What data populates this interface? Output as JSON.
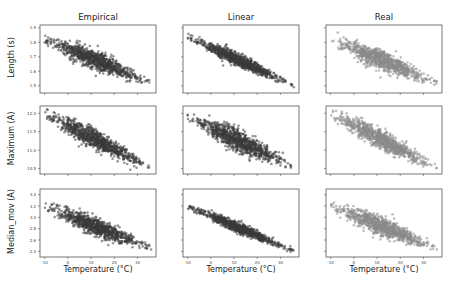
{
  "figure": {
    "columns": [
      "Empirical",
      "Linear",
      "Real"
    ],
    "rows": [
      "Length (s)",
      "Maximum (A)",
      "Median_mov (A)"
    ],
    "xlabel": "Temperature (°C)"
  },
  "colors": {
    "empirical": "#3a3a3a",
    "linear": "#3a3a3a",
    "real": "#8a8a8a",
    "axes": "#555555"
  },
  "chart_data": {
    "type": "scatter",
    "title": "",
    "layout": "3x3 grid of scatter plots, negative correlation with temperature",
    "grid": false,
    "legend": "none",
    "x_axis": {
      "label": "Temperature (°C)",
      "ticks": [
        -10,
        0,
        10,
        20,
        30
      ],
      "range": [
        -12,
        38
      ]
    },
    "panels": [
      {
        "row": "Length (s)",
        "column": "Empirical",
        "yticks": [
          1.5,
          1.6,
          1.7,
          1.8,
          1.9
        ],
        "ylim": [
          1.45,
          1.92
        ],
        "x_range": [
          -10,
          36
        ],
        "y_at_xmin": 1.82,
        "y_at_xmax": 1.52,
        "spread": 0.07
      },
      {
        "row": "Length (s)",
        "column": "Linear",
        "yticks": [
          1.5,
          1.6,
          1.7,
          1.8,
          1.9
        ],
        "ylim": [
          1.45,
          1.92
        ],
        "x_range": [
          -10,
          36
        ],
        "y_at_xmin": 1.84,
        "y_at_xmax": 1.5,
        "spread": 0.045
      },
      {
        "row": "Length (s)",
        "column": "Real",
        "yticks": [
          1.5,
          1.6,
          1.7,
          1.8,
          1.9
        ],
        "ylim": [
          1.45,
          1.92
        ],
        "x_range": [
          -10,
          36
        ],
        "y_at_xmin": 1.82,
        "y_at_xmax": 1.52,
        "spread": 0.07
      },
      {
        "row": "Maximum (A)",
        "column": "Empirical",
        "yticks": [
          10.5,
          11.0,
          11.5,
          12.0
        ],
        "ylim": [
          10.35,
          12.2
        ],
        "x_range": [
          -10,
          36
        ],
        "y_at_xmin": 12.0,
        "y_at_xmax": 10.5,
        "spread": 0.28
      },
      {
        "row": "Maximum (A)",
        "column": "Linear",
        "yticks": [
          10.5,
          11.0,
          11.5,
          12.0
        ],
        "ylim": [
          10.35,
          12.2
        ],
        "x_range": [
          -10,
          36
        ],
        "y_at_xmin": 11.9,
        "y_at_xmax": 10.55,
        "spread": 0.3
      },
      {
        "row": "Maximum (A)",
        "column": "Real",
        "yticks": [
          10.5,
          11.0,
          11.5,
          12.0
        ],
        "ylim": [
          10.35,
          12.2
        ],
        "x_range": [
          -10,
          36
        ],
        "y_at_xmin": 12.0,
        "y_at_xmax": 10.5,
        "spread": 0.28
      },
      {
        "row": "Median_mov (A)",
        "column": "Empirical",
        "yticks": [
          2.4,
          2.6,
          2.8,
          3.0,
          3.2,
          3.4
        ],
        "ylim": [
          2.3,
          3.5
        ],
        "x_range": [
          -10,
          36
        ],
        "y_at_xmin": 3.2,
        "y_at_xmax": 2.45,
        "spread": 0.17
      },
      {
        "row": "Median_mov (A)",
        "column": "Linear",
        "yticks": [
          2.4,
          2.6,
          2.8,
          3.0,
          3.2,
          3.4
        ],
        "ylim": [
          2.3,
          3.5
        ],
        "x_range": [
          -10,
          36
        ],
        "y_at_xmin": 3.2,
        "y_at_xmax": 2.4,
        "spread": 0.1
      },
      {
        "row": "Median_mov (A)",
        "column": "Real",
        "yticks": [
          2.4,
          2.6,
          2.8,
          3.0,
          3.2,
          3.4
        ],
        "ylim": [
          2.3,
          3.5
        ],
        "x_range": [
          -10,
          36
        ],
        "y_at_xmin": 3.2,
        "y_at_xmax": 2.45,
        "spread": 0.17
      }
    ]
  }
}
